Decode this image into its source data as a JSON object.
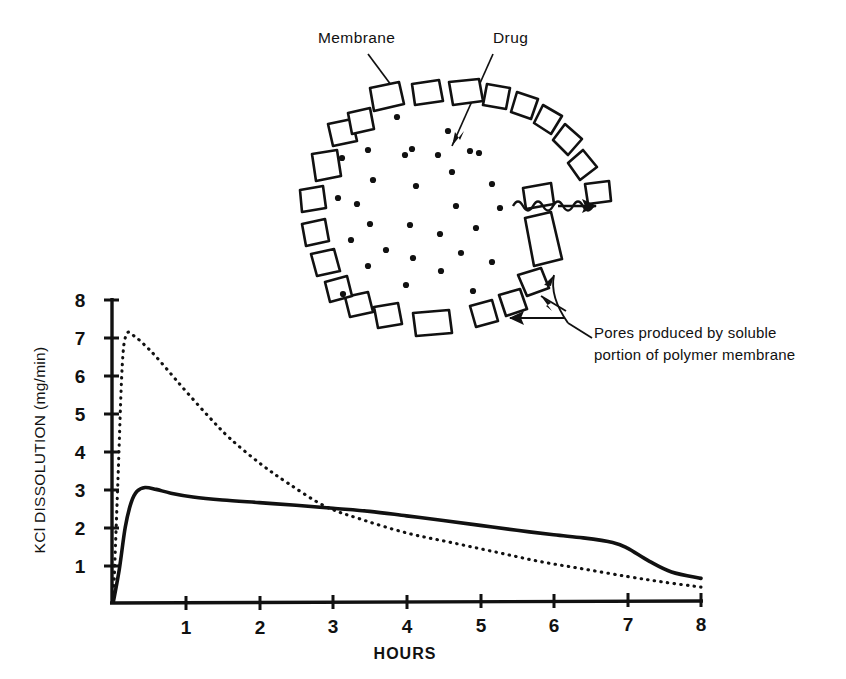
{
  "figure": {
    "diagram": {
      "title_labels": {
        "membrane": "Membrane",
        "drug": "Drug",
        "pores_line1": "Pores produced by soluble",
        "pores_line2": "portion of polymer  membrane"
      },
      "shape": "circular-membrane-cross-section",
      "membrane_blocks": 24,
      "drug_particles": 31,
      "release_arrow": "wavy-release-arrow"
    },
    "chart_data": {
      "type": "line",
      "title": "",
      "xlabel": "HOURS",
      "ylabel": "KCl DISSOLUTION (mg/min)",
      "xlim": [
        0,
        8
      ],
      "ylim": [
        0,
        8
      ],
      "xticks": [
        1,
        2,
        3,
        4,
        5,
        6,
        7,
        8
      ],
      "yticks": [
        1,
        2,
        3,
        4,
        5,
        6,
        7,
        8
      ],
      "grid": false,
      "legend": "none",
      "series": [
        {
          "name": "Conventional (dotted)",
          "style": "dotted",
          "x": [
            0.02,
            0.08,
            0.14,
            0.2,
            0.3,
            0.45,
            0.6,
            0.8,
            1.0,
            1.3,
            1.6,
            2.0,
            2.4,
            2.9,
            3.4,
            4.0,
            4.6,
            5.2,
            5.8,
            6.4,
            7.0,
            7.5,
            8.0
          ],
          "values": [
            0.1,
            3.2,
            6.3,
            7.1,
            7.05,
            6.8,
            6.5,
            6.05,
            5.6,
            4.95,
            4.35,
            3.7,
            3.15,
            2.55,
            2.2,
            1.85,
            1.6,
            1.35,
            1.1,
            0.9,
            0.7,
            0.55,
            0.42
          ]
        },
        {
          "name": "Coated / membrane (solid)",
          "style": "solid",
          "x": [
            0.02,
            0.1,
            0.18,
            0.26,
            0.34,
            0.45,
            0.6,
            0.8,
            1.1,
            1.5,
            2.0,
            2.5,
            3.0,
            3.5,
            4.0,
            4.5,
            5.0,
            5.5,
            6.0,
            6.4,
            6.8,
            7.0,
            7.3,
            7.6,
            8.0
          ],
          "values": [
            0.05,
            0.9,
            2.0,
            2.65,
            2.95,
            3.05,
            3.0,
            2.9,
            2.8,
            2.72,
            2.65,
            2.58,
            2.5,
            2.42,
            2.3,
            2.18,
            2.05,
            1.92,
            1.8,
            1.72,
            1.6,
            1.45,
            1.1,
            0.82,
            0.65
          ]
        }
      ]
    }
  }
}
